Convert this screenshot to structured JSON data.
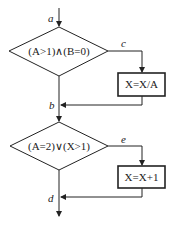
{
  "diagram": {
    "type": "flowchart",
    "edge_labels": {
      "a": "a",
      "b": "b",
      "c": "c",
      "d": "d",
      "e": "e"
    },
    "decision1": {
      "text": "(A>1)∧(B=0)"
    },
    "process1": {
      "text": "X=X/A"
    },
    "decision2": {
      "text": "(A=2)∨(X>1)"
    },
    "process2": {
      "text": "X=X+1"
    },
    "colors": {
      "stroke": "#222222",
      "background": "#ffffff"
    }
  }
}
